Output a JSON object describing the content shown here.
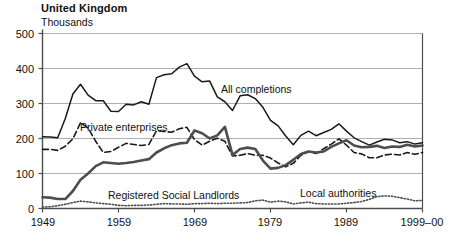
{
  "header": {
    "title": "United Kingdom",
    "subtitle": "Thousands"
  },
  "chart_data": {
    "type": "line",
    "title": "United Kingdom",
    "subtitle": "Thousands",
    "xlabel": "",
    "ylabel": "Thousands",
    "ylim": [
      0,
      500
    ],
    "yticks": [
      0,
      100,
      200,
      300,
      400,
      500
    ],
    "ytick_labels": [
      "0",
      "100",
      "200",
      "300",
      "400",
      "500"
    ],
    "xlim": [
      1949,
      1999
    ],
    "xticks": [
      1949,
      1959,
      1969,
      1979,
      1989,
      1999
    ],
    "xtick_labels": [
      "1949",
      "1959",
      "1969",
      "1979",
      "1989",
      "1999–00"
    ],
    "grid": "horizontal",
    "legend": "inline-annotations",
    "x": [
      1949,
      1950,
      1951,
      1952,
      1953,
      1954,
      1955,
      1956,
      1957,
      1958,
      1959,
      1960,
      1961,
      1962,
      1963,
      1964,
      1965,
      1966,
      1967,
      1968,
      1969,
      1970,
      1971,
      1972,
      1973,
      1974,
      1975,
      1976,
      1977,
      1978,
      1979,
      1980,
      1981,
      1982,
      1983,
      1984,
      1985,
      1986,
      1987,
      1988,
      1989,
      1990,
      1991,
      1992,
      1993,
      1994,
      1995,
      1996,
      1997,
      1998,
      1999
    ],
    "series": [
      {
        "name": "All completions",
        "label": "All completions",
        "style": "solid-thin",
        "color": "#1a1a1a",
        "values": [
          205,
          204,
          202,
          257,
          327,
          355,
          324,
          308,
          308,
          278,
          277,
          298,
          296,
          305,
          298,
          374,
          382,
          385,
          404,
          414,
          378,
          362,
          364,
          319,
          305,
          280,
          322,
          325,
          314,
          289,
          252,
          236,
          207,
          182,
          209,
          221,
          208,
          217,
          226,
          242,
          221,
          202,
          191,
          181,
          190,
          198,
          196,
          188,
          191,
          184,
          188
        ]
      },
      {
        "name": "Private enterprises",
        "label": "Private enterprises",
        "style": "dashed",
        "color": "#1a1a1a",
        "values": [
          169,
          169,
          166,
          178,
          199,
          245,
          230,
          192,
          160,
          163,
          175,
          186,
          183,
          180,
          183,
          222,
          220,
          218,
          228,
          232,
          197,
          181,
          192,
          201,
          192,
          150,
          152,
          157,
          152,
          152,
          144,
          130,
          119,
          129,
          152,
          162,
          157,
          171,
          184,
          199,
          181,
          160,
          156,
          145,
          145,
          153,
          155,
          153,
          160,
          155,
          160
        ]
      },
      {
        "name": "Local authorities",
        "label": "Local authorities",
        "style": "solid-thick",
        "color": "#4d4d4d",
        "values": [
          32,
          31,
          27,
          27,
          50,
          82,
          100,
          121,
          132,
          130,
          128,
          130,
          133,
          137,
          141,
          160,
          172,
          181,
          186,
          188,
          223,
          215,
          200,
          209,
          233,
          153,
          170,
          174,
          170,
          137,
          114,
          116,
          124,
          139,
          156,
          163,
          160,
          163,
          176,
          186,
          195,
          180,
          175,
          176,
          179,
          173,
          177,
          176,
          182,
          177,
          180
        ]
      },
      {
        "name": "Registered Social Landlords",
        "label": "Registered Social Landlords",
        "style": "dotted",
        "color": "#4d4d4d",
        "values": [
          4,
          5,
          8,
          12,
          17,
          21,
          19,
          16,
          14,
          12,
          9,
          8,
          9,
          9,
          10,
          12,
          14,
          13,
          13,
          12,
          14,
          14,
          15,
          14,
          15,
          15,
          16,
          17,
          22,
          24,
          18,
          21,
          19,
          13,
          16,
          18,
          14,
          13,
          13,
          13,
          15,
          17,
          20,
          26,
          34,
          36,
          35,
          31,
          27,
          22,
          23
        ]
      }
    ],
    "annotations": [
      {
        "text": "All completions",
        "x_px": 221,
        "y_px": 83
      },
      {
        "text": "Private enterprises",
        "x_px": 80,
        "y_px": 121
      },
      {
        "text": "Registered Social Landlords",
        "x_px": 108,
        "y_px": 189
      },
      {
        "text": "Local authorities",
        "x_px": 300,
        "y_px": 187
      }
    ]
  },
  "axis": {
    "y_labels": [
      {
        "text": "500",
        "top": 28
      },
      {
        "text": "400",
        "top": 63
      },
      {
        "text": "300",
        "top": 98
      },
      {
        "text": "200",
        "top": 133
      },
      {
        "text": "100",
        "top": 168
      },
      {
        "text": "0",
        "top": 203
      }
    ],
    "x_labels": [
      {
        "text": "1949",
        "left": 43
      },
      {
        "text": "1959",
        "left": 119
      },
      {
        "text": "1969",
        "left": 195
      },
      {
        "text": "1979",
        "left": 270
      },
      {
        "text": "1989",
        "left": 346
      },
      {
        "text": "1999–00",
        "left": 422
      }
    ]
  },
  "colors": {
    "gridline": "#b0b0b0",
    "axis": "#4d4d4d",
    "text": "#111111",
    "all_completions": "#1a1a1a",
    "private_enterprises": "#1a1a1a",
    "local_authorities": "#4d4d4d",
    "registered_social_landlords": "#4d4d4d"
  }
}
